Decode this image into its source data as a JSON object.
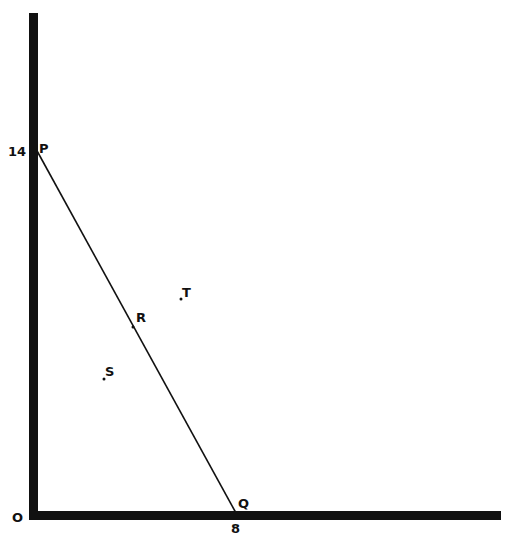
{
  "diagram": {
    "type": "coordinate-geometry",
    "origin_label": "O",
    "axes": {
      "x_tick_label": "8",
      "y_tick_label": "14"
    },
    "points": [
      {
        "name": "P",
        "x": 0,
        "y": 14,
        "label": "P"
      },
      {
        "name": "Q",
        "x": 8,
        "y": 0,
        "label": "Q"
      },
      {
        "name": "R",
        "label": "R"
      },
      {
        "name": "S",
        "label": "S"
      },
      {
        "name": "T",
        "label": "T"
      }
    ],
    "segments": [
      {
        "from": "P",
        "to": "Q"
      }
    ],
    "colors": {
      "axis": "#111111",
      "line": "#111111",
      "background": "#ffffff"
    }
  }
}
